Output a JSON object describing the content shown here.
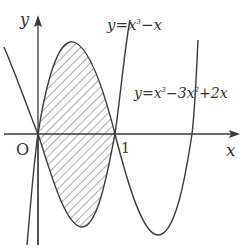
{
  "diagram": {
    "axes": {
      "x_label": "x",
      "y_label": "y",
      "origin_label": "O",
      "tick_label_1": "1"
    },
    "curves": [
      {
        "name": "cubic-1",
        "equation_parts": {
          "lhs": "y=x",
          "exp": "3",
          "rest": "−x"
        },
        "equation": "y=x³−x"
      },
      {
        "name": "cubic-2",
        "equation_parts": {
          "lhs": "y=x",
          "exp1": "3",
          "mid": "−3x",
          "exp2": "2",
          "rest": "+2x"
        },
        "equation": "y=x³−3x²+2x"
      }
    ],
    "shaded_region": "area enclosed between the two curves from x=0 to x=1",
    "colors": {
      "stroke": "#3a3a3a",
      "hatch": "#555555",
      "background": "#ffffff"
    }
  }
}
